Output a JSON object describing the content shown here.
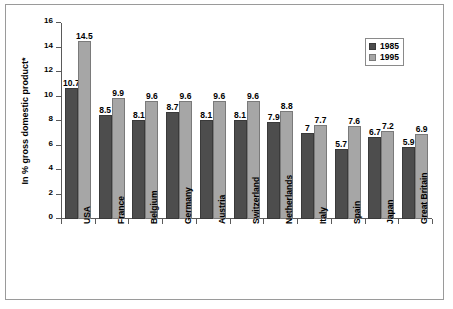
{
  "chart_data": {
    "type": "bar",
    "title": "",
    "xlabel": "",
    "ylabel": "In % gross domestic product*",
    "ylim": [
      0,
      16
    ],
    "yticks": [
      0,
      2,
      4,
      6,
      8,
      10,
      12,
      14,
      16
    ],
    "ytick_labels": [
      "0",
      "2",
      "4",
      "6",
      "8",
      "10",
      "12",
      "14",
      "16"
    ],
    "grid": false,
    "legend_position": "top-right",
    "categories": [
      "USA",
      "France",
      "Belgium",
      "Germany",
      "Austria",
      "Switzerland",
      "Netherlands",
      "Italy",
      "Spain",
      "Japan",
      "Great Britain"
    ],
    "series": [
      {
        "name": "1985",
        "color": "#4d4d4d",
        "values": [
          10.7,
          8.5,
          8.1,
          8.7,
          8.1,
          8.1,
          7.9,
          7,
          5.7,
          6.7,
          5.9
        ],
        "labels": [
          "10.7",
          "8.5",
          "8.1",
          "8.7",
          "8.1",
          "8.1",
          "7.9",
          "7",
          "5.7",
          "6.7",
          "5.9"
        ]
      },
      {
        "name": "1995",
        "color": "#a6a6a6",
        "values": [
          14.5,
          9.9,
          9.6,
          9.6,
          9.6,
          9.6,
          8.8,
          7.7,
          7.6,
          7.2,
          6.9
        ],
        "labels": [
          "14.5",
          "9.9",
          "9.6",
          "9.6",
          "9.6",
          "9.6",
          "8.8",
          "7.7",
          "7.6",
          "7.2",
          "6.9"
        ]
      }
    ]
  },
  "legend": {
    "items": [
      {
        "label": "1985",
        "color": "#4d4d4d"
      },
      {
        "label": "1995",
        "color": "#a6a6a6"
      }
    ]
  },
  "axis": {
    "y_title": "In % gross domestic product*"
  }
}
